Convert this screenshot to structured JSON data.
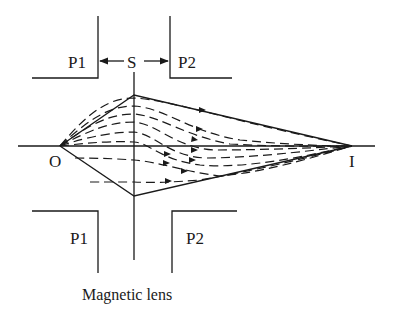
{
  "diagram": {
    "title": "Magnetic lens",
    "labels": {
      "object": "O",
      "image": "I",
      "slit": "S",
      "pole_top_left": "P1",
      "pole_top_right": "P2",
      "pole_bottom_left": "P1",
      "pole_bottom_right": "P2",
      "caption": "Magnetic lens"
    },
    "colors": {
      "ink": "#1a1a1a",
      "background": "#ffffff"
    },
    "elements": {
      "optical_axis": "horizontal line through O and I",
      "lens_plane": "vertical line through S",
      "envelope_rays": "solid straight lines O→lens→I",
      "electron_paths": "dashed curved paths with arrowheads converging at I"
    }
  }
}
